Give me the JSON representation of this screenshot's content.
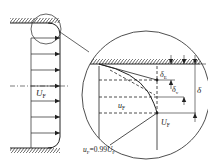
{
  "diagram": {
    "labels": {
      "core_velocity": {
        "main": "U",
        "sub": "F"
      },
      "local_velocity": {
        "main": "u",
        "sub": "F"
      },
      "edge_velocity": {
        "main": "U",
        "sub": "F"
      },
      "criterion": {
        "lhs_main": "u",
        "lhs_sub": "F",
        "eq": "=0.99",
        "rhs_main": "U",
        "rhs_sub": "F"
      },
      "delta_E": {
        "main": "δ",
        "sub": "E"
      },
      "delta_v": {
        "main": "δ",
        "sub": "v"
      },
      "delta": {
        "main": "δ"
      }
    },
    "colors": {
      "ink": "#222222",
      "background": "#ffffff"
    }
  }
}
